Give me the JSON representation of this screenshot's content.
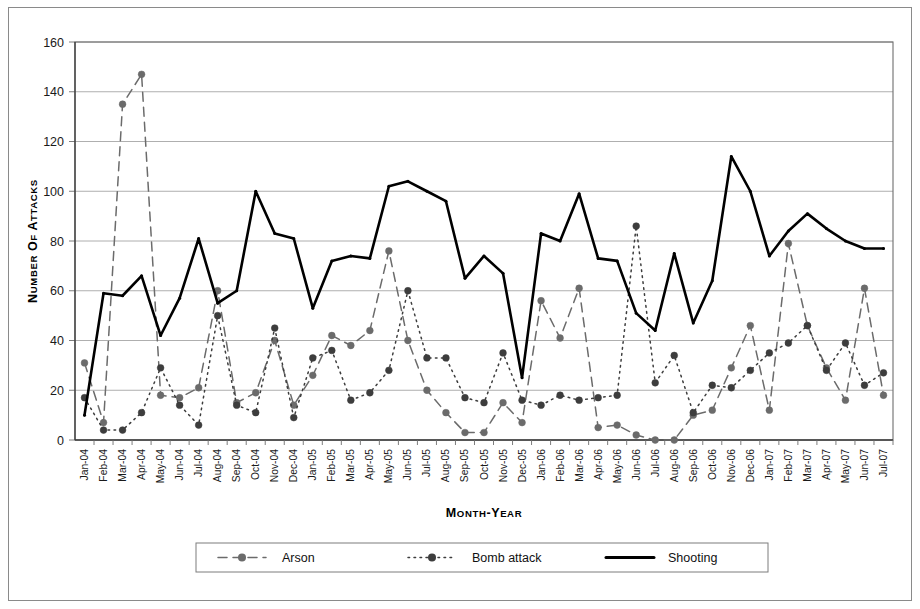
{
  "figure": {
    "background": "#ffffff",
    "frame_color": "#8a8a8a"
  },
  "axes": {
    "y_title": "Number of Attacks",
    "x_title": "Month-Year",
    "y_ticks": [
      0,
      20,
      40,
      60,
      80,
      100,
      120,
      140,
      160
    ],
    "y_min": 0,
    "y_max": 160,
    "grid": true
  },
  "legend": {
    "position": "bottom",
    "items": [
      {
        "label": "Arson",
        "style": "dashed",
        "marker": "circle",
        "color": "#6b6b6b"
      },
      {
        "label": "Bomb attack",
        "style": "dotted",
        "marker": "circle",
        "color": "#3d3d3d"
      },
      {
        "label": "Shooting",
        "style": "solid",
        "marker": "none",
        "color": "#000000"
      }
    ]
  },
  "chart_data": {
    "type": "line",
    "title": "",
    "subtitle": "",
    "xlabel": "Month-Year",
    "ylabel": "Number of Attacks",
    "ylim": [
      0,
      160
    ],
    "grid": true,
    "legend_position": "bottom",
    "categories": [
      "Jan-04",
      "Feb-04",
      "Mar-04",
      "Apr-04",
      "May-04",
      "Jun-04",
      "Jul-04",
      "Aug-04",
      "Sep-04",
      "Oct-04",
      "Nov-04",
      "Dec-04",
      "Jan-05",
      "Feb-05",
      "Mar-05",
      "Apr-05",
      "May-05",
      "Jun-05",
      "Jul-05",
      "Aug-05",
      "Sep-05",
      "Oct-05",
      "Nov-05",
      "Dec-05",
      "Jan-06",
      "Feb-06",
      "Mar-06",
      "Apr-06",
      "May-06",
      "Jun-06",
      "Jul-06",
      "Aug-06",
      "Sep-06",
      "Oct-06",
      "Nov-06",
      "Dec-06",
      "Jan-07",
      "Feb-07",
      "Mar-07",
      "Apr-07",
      "May-07",
      "Jun-07",
      "Jul-07"
    ],
    "series": [
      {
        "name": "Arson",
        "color": "#6b6b6b",
        "style": "dashed",
        "marker": "circle",
        "values": [
          31,
          7,
          135,
          147,
          18,
          17,
          21,
          60,
          15,
          19,
          40,
          14,
          26,
          42,
          38,
          44,
          76,
          40,
          20,
          11,
          3,
          3,
          15,
          7,
          56,
          41,
          61,
          5,
          6,
          2,
          0,
          0,
          10,
          12,
          29,
          46,
          12,
          79,
          46,
          29,
          16,
          61,
          18
        ]
      },
      {
        "name": "Bomb attack",
        "color": "#3d3d3d",
        "style": "dotted",
        "marker": "circle",
        "values": [
          17,
          4,
          4,
          11,
          29,
          14,
          6,
          50,
          14,
          11,
          45,
          9,
          33,
          36,
          16,
          19,
          28,
          60,
          33,
          33,
          17,
          15,
          35,
          16,
          14,
          18,
          16,
          17,
          18,
          86,
          23,
          34,
          11,
          22,
          21,
          28,
          35,
          39,
          46,
          28,
          39,
          22,
          27
        ]
      },
      {
        "name": "Shooting",
        "color": "#000000",
        "style": "solid",
        "marker": "none",
        "values": [
          10,
          59,
          58,
          66,
          42,
          57,
          81,
          55,
          60,
          100,
          83,
          81,
          53,
          72,
          74,
          73,
          102,
          104,
          100,
          96,
          65,
          74,
          67,
          25,
          83,
          80,
          99,
          73,
          72,
          51,
          44,
          75,
          47,
          64,
          114,
          100,
          74,
          84,
          91,
          85,
          80,
          77,
          77
        ]
      }
    ]
  }
}
